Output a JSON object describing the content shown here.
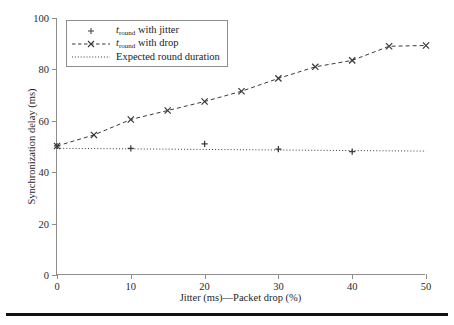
{
  "chart_data": {
    "type": "line",
    "title": "",
    "xlabel": "Jitter (ms)—Packet drop (%)",
    "ylabel": "Synchronization delay (ms)",
    "xlim": [
      0,
      50
    ],
    "ylim": [
      0,
      100
    ],
    "xticks": [
      0,
      10,
      20,
      30,
      40,
      50
    ],
    "yticks": [
      0,
      20,
      40,
      60,
      80,
      100
    ],
    "xtick_labels": [
      "0",
      "10",
      "20",
      "30",
      "40",
      "50"
    ],
    "ytick_labels": [
      "0",
      "20",
      "40",
      "60",
      "80",
      "100"
    ],
    "grid": false,
    "legend_position": "upper left",
    "series": [
      {
        "name": "t_round with jitter",
        "legend_label_html": "<i>t</i><sub>round</sub> with jitter",
        "marker": "plus",
        "linestyle": "none",
        "color": "#3a3a3a",
        "x": [
          0,
          10,
          20,
          30,
          40
        ],
        "values": [
          50.2,
          49.3,
          51.0,
          49.0,
          48.0
        ]
      },
      {
        "name": "t_round with drop",
        "legend_label_html": "<i>t</i><sub>round</sub> with drop",
        "marker": "x",
        "linestyle": "dashed",
        "color": "#3a3a3a",
        "x": [
          0,
          5,
          10,
          15,
          20,
          25,
          30,
          35,
          40,
          45,
          50
        ],
        "values": [
          50.2,
          54.5,
          60.5,
          64.0,
          67.5,
          71.5,
          76.5,
          81.0,
          83.5,
          89.0,
          89.3
        ]
      },
      {
        "name": "Expected round duration",
        "legend_label_html": "Expected round duration",
        "marker": "none",
        "linestyle": "dotted",
        "color": "#3a3a3a",
        "x": [
          0,
          50
        ],
        "values": [
          49.3,
          48.2
        ]
      }
    ]
  },
  "axis_color": "#8d8d8d",
  "legend": {
    "items": [
      "t_round with jitter",
      "t_round with drop",
      "Expected round duration"
    ]
  }
}
